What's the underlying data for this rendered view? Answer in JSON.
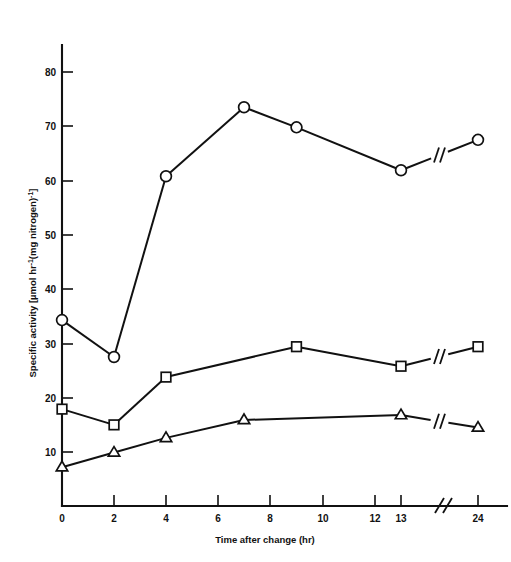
{
  "figure": {
    "background_color": "#ffffff",
    "ink_color": "#111111",
    "marker_fill_color": "#ffffff"
  },
  "chart_data": {
    "type": "line",
    "title": "",
    "subtitle": "",
    "xlabel": "Time after change (hr)",
    "ylabel": "Specific activity [µmol hr⁻¹(mg nitrogen)⁻¹]",
    "ylabel_parts": {
      "prefix": "Specific activity [",
      "unit_num": "µmol hr",
      "sup1": "-1",
      "unit_den": "(mg nitrogen)",
      "sup2": "-1",
      "suffix": "]"
    },
    "grid": false,
    "legend": "none",
    "axis_break": {
      "present": true,
      "axis": "x",
      "symbol": "//",
      "between": [
        13,
        24
      ],
      "note": "x axis is broken between 13 hr and 24 hr; each series line also carries a break slash"
    },
    "xlim": [
      0,
      24
    ],
    "ylim": [
      0,
      85
    ],
    "x_tick_labels": [
      "0",
      "2",
      "4",
      "6",
      "8",
      "10",
      "12",
      "13",
      "24"
    ],
    "x_tick_values": [
      0,
      2,
      4,
      6,
      8,
      10,
      12,
      13,
      24
    ],
    "y_tick_labels": [
      "10",
      "20",
      "30",
      "40",
      "50",
      "60",
      "70",
      "80"
    ],
    "y_tick_values": [
      10,
      20,
      30,
      40,
      50,
      60,
      70,
      80
    ],
    "series": [
      {
        "name": "circle-series",
        "marker": "circle",
        "x": [
          0,
          2,
          4,
          7,
          9,
          13,
          24
        ],
        "values": [
          34.3,
          27.5,
          60.8,
          73.5,
          69.8,
          61.9,
          67.5
        ]
      },
      {
        "name": "square-series",
        "marker": "square",
        "x": [
          0,
          2,
          4,
          9,
          13,
          24
        ],
        "values": [
          17.9,
          15.0,
          23.8,
          29.4,
          25.8,
          29.4
        ]
      },
      {
        "name": "triangle-series",
        "marker": "triangle",
        "x": [
          0,
          2,
          4,
          7,
          13,
          24
        ],
        "values": [
          7.2,
          9.9,
          12.6,
          15.9,
          16.8,
          14.5
        ]
      }
    ]
  }
}
